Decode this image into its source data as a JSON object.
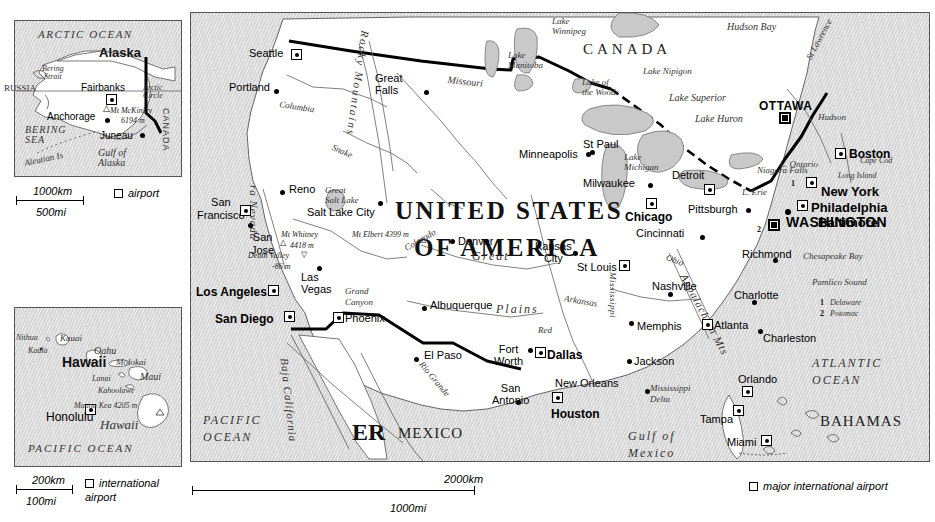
{
  "figure": {
    "type": "reference-map",
    "panels": [
      "alaska-inset",
      "hawaii-inset",
      "main-map"
    ]
  },
  "alaska": {
    "title": "Alaska",
    "ocean_labels": [
      "ARCTIC OCEAN",
      "BERING SEA",
      "Gulf of Alaska"
    ],
    "water_features": [
      "Bering Strait",
      "Aleutian Is"
    ],
    "neighbours": [
      "RUSSIA",
      "CANADA"
    ],
    "reference_line": "Arctic Circle",
    "cities": [
      {
        "name": "Fairbanks",
        "marker": "airport"
      },
      {
        "name": "Anchorage",
        "marker": "dot"
      },
      {
        "name": "Juneau",
        "marker": "dot"
      }
    ],
    "peaks": [
      {
        "name": "Mt McKinley",
        "elevation": "6194 m"
      }
    ],
    "scale": {
      "km": "1000km",
      "mi": "500mi"
    },
    "legend": {
      "symbol": "hollow-square",
      "label": "airport"
    }
  },
  "hawaii": {
    "title": "Hawaii",
    "ocean_label": "PACIFIC OCEAN",
    "islands": [
      "Nithua",
      "Kauai",
      "Kaula",
      "Oahu",
      "Molokai",
      "Lanai",
      "Maui",
      "Kahoolawe",
      "Hawaii"
    ],
    "cities": [
      {
        "name": "Honolulu",
        "marker": "airport"
      }
    ],
    "peaks": [
      {
        "name": "Mauna Kea",
        "elevation": "4205 m"
      }
    ],
    "scale": {
      "km": "200km",
      "mi": "100mi"
    },
    "legend": {
      "symbol": "hollow-square",
      "label": "international airport"
    }
  },
  "main": {
    "country_labels": [
      "UNITED STATES",
      "OF AMERICA",
      "CANADA",
      "MEXICO",
      "ER",
      "BAHAMAS"
    ],
    "oceans": [
      "PACIFIC OCEAN",
      "ATLANTIC OCEAN",
      "Gulf of Mexico"
    ],
    "regions": [
      "Great Plains",
      "Rocky Mountains",
      "Sierra Nevada",
      "Appalachian Mts",
      "Baja California",
      "Grand Canyon",
      "Mississippi Delta"
    ],
    "lakes": [
      "Lake Winnipeg",
      "Lake Manitoba",
      "Lake of the Woods",
      "Lake Nipigon",
      "Lake Superior",
      "Lake Huron",
      "Lake Michigan",
      "L. Erie",
      "L. Ontario",
      "Great Salt Lake",
      "Hudson Bay"
    ],
    "rivers": [
      "Columbia",
      "Snake",
      "Missouri",
      "Mississippi",
      "Arkansas",
      "Red",
      "Colorado",
      "Rio Grande",
      "Ohio",
      "St Lawrence",
      "Hudson"
    ],
    "coastal_features": [
      "Cape Cod",
      "Long Island",
      "Chesapeake Bay",
      "Pamlico Sound",
      "Niagara Falls"
    ],
    "peaks": [
      {
        "name": "Mt Whitney",
        "elevation": "4418 m"
      },
      {
        "name": "Mt Elbert",
        "elevation": "4399 m"
      },
      {
        "name": "Death Valley",
        "elevation": "-86 m"
      }
    ],
    "capitals": [
      {
        "name": "WASHINGTON",
        "marker": "capital-airport"
      },
      {
        "name": "OTTAWA",
        "marker": "capital-airport"
      }
    ],
    "cities": [
      {
        "name": "Seattle",
        "marker": "airport"
      },
      {
        "name": "Portland",
        "marker": "dot"
      },
      {
        "name": "Great Falls",
        "marker": "dot"
      },
      {
        "name": "San Francisco",
        "marker": "airport"
      },
      {
        "name": "San Jose",
        "marker": "dot"
      },
      {
        "name": "Reno",
        "marker": "dot"
      },
      {
        "name": "Salt Lake City",
        "marker": "dot"
      },
      {
        "name": "Las Vegas",
        "marker": "dot"
      },
      {
        "name": "Los Angeles",
        "marker": "airport"
      },
      {
        "name": "San Diego",
        "marker": "airport"
      },
      {
        "name": "Phoenix",
        "marker": "airport"
      },
      {
        "name": "Albuquerque",
        "marker": "dot"
      },
      {
        "name": "El Paso",
        "marker": "dot"
      },
      {
        "name": "Denver",
        "marker": "dot"
      },
      {
        "name": "Minneapolis",
        "marker": "dot"
      },
      {
        "name": "St Paul",
        "marker": "dot"
      },
      {
        "name": "Milwaukee",
        "marker": "dot"
      },
      {
        "name": "Chicago",
        "marker": "airport"
      },
      {
        "name": "Detroit",
        "marker": "airport"
      },
      {
        "name": "Pittsburgh",
        "marker": "dot"
      },
      {
        "name": "Cincinnati",
        "marker": "dot"
      },
      {
        "name": "Kansas City",
        "marker": "dot"
      },
      {
        "name": "St Louis",
        "marker": "airport"
      },
      {
        "name": "Fort Worth",
        "marker": "dot"
      },
      {
        "name": "Dallas",
        "marker": "airport"
      },
      {
        "name": "San Antonio",
        "marker": "dot"
      },
      {
        "name": "Houston",
        "marker": "airport"
      },
      {
        "name": "New Orleans",
        "marker": "dot"
      },
      {
        "name": "Jackson",
        "marker": "dot"
      },
      {
        "name": "Memphis",
        "marker": "dot"
      },
      {
        "name": "Nashville",
        "marker": "dot"
      },
      {
        "name": "Atlanta",
        "marker": "airport"
      },
      {
        "name": "Charlotte",
        "marker": "dot"
      },
      {
        "name": "Charleston",
        "marker": "dot"
      },
      {
        "name": "Richmond",
        "marker": "dot"
      },
      {
        "name": "Baltimore",
        "marker": "dot"
      },
      {
        "name": "Philadelphia",
        "marker": "airport"
      },
      {
        "name": "New York",
        "marker": "airport"
      },
      {
        "name": "Boston",
        "marker": "airport"
      },
      {
        "name": "Orlando",
        "marker": "airport"
      },
      {
        "name": "Tampa",
        "marker": "airport"
      },
      {
        "name": "Miami",
        "marker": "airport"
      }
    ],
    "numbered_keys": [
      {
        "num": "1",
        "name": "Delaware"
      },
      {
        "num": "2",
        "name": "Potomac"
      }
    ],
    "scale": {
      "km": "2000km",
      "mi": "1000mi"
    },
    "legend": {
      "symbol": "hollow-square",
      "label": "major international airport"
    }
  },
  "labels": {
    "ak_title": "Alaska",
    "ak_arctic_ocean": "ARCTIC OCEAN",
    "ak_bering_strait": "Bering\nStrait",
    "ak_russia": "RUSSIA",
    "ak_canada": "CANADA",
    "ak_arctic_circle": "Arctic\nCircle",
    "ak_fairbanks": "Fairbanks",
    "ak_mckinley": "Mt McKinley",
    "ak_mckinley_el": "6194 m",
    "ak_anchorage": "Anchorage",
    "ak_juneau": "Juneau",
    "ak_bering_sea": "BERING\nSEA",
    "ak_aleutian": "Aleutian Is",
    "ak_gulf": "Gulf of\nAlaska",
    "ak_scale_km": "1000km",
    "ak_scale_mi": "500mi",
    "ak_legend": "airport",
    "hi_title": "Hawaii",
    "hi_nithua": "Nithua",
    "hi_kauai": "Kauai",
    "hi_kaula": "Kaula",
    "hi_oahu": "Oahu",
    "hi_honolulu": "Honolulu",
    "hi_molokai": "Molokai",
    "hi_lanai": "Lanai",
    "hi_maui": "Maui",
    "hi_kahoolawe": "Kahoolawe",
    "hi_maunakea": "Mauna Kea 4205 m",
    "hi_bigisland": "Hawaii",
    "hi_pacific": "PACIFIC OCEAN",
    "hi_scale_km": "200km",
    "hi_scale_mi": "100mi",
    "hi_legend": "international\nairport",
    "m_canada": "CANADA",
    "m_us1": "UNITED STATES",
    "m_us2": "OF AMERICA",
    "m_mexico": "MEXICO",
    "m_er": "ER",
    "m_bahamas": "BAHAMAS",
    "m_pacific": "PACIFIC\nOCEAN",
    "m_atlantic": "ATLANTIC\nOCEAN",
    "m_gulf": "Gulf of\nMexico",
    "m_hudson_bay": "Hudson Bay",
    "m_lk_winnipeg": "Lake\nWinnipeg",
    "m_lk_manitoba": "Lake\nManitoba",
    "m_lk_woods": "Lake of\nthe Woods",
    "m_lk_nipigon": "Lake Nipigon",
    "m_lk_superior": "Lake Superior",
    "m_lk_huron": "Lake Huron",
    "m_lk_michigan": "Lake\nMichigan",
    "m_l_erie": "L. Erie",
    "m_l_ontario": "L. Ontario",
    "m_niagara": "Niagara Falls",
    "m_stlawrence": "St Lawrence",
    "m_hudson": "Hudson",
    "m_capecod": "Cape Cod",
    "m_longisland": "Long Island",
    "m_chesapeake": "Chesapeake Bay",
    "m_pamlico": "Pamlico Sound",
    "m_rockies": "Rocky Mountains",
    "m_sierra": "ra Nevada",
    "m_appalachian": "Appalachian Mts",
    "m_greatplains_g": "Great",
    "m_greatplains_p": "Plains",
    "m_baja": "Baja California",
    "m_grandcanyon": "Grand\nCanyon",
    "m_missdelta": "Mississippi\nDelta",
    "m_greatsaltlake": "Great\nSalt Lake",
    "m_columbia": "Columbia",
    "m_snake": "Snake",
    "m_missouri": "Missouri",
    "m_mississippi": "Mississippi",
    "m_arkansas": "Arkansas",
    "m_red": "Red",
    "m_colorado": "Colorado",
    "m_riogrande": "Rio Grande",
    "m_ohio": "Ohio",
    "m_whitney": "Mt Whitney",
    "m_whitney_el": "4418 m",
    "m_elbert": "Mt Elbert 4399 m",
    "m_deathvalley": "Death Valley",
    "m_deathvalley_el": "-86 m",
    "m_seattle": "Seattle",
    "m_portland": "Portland",
    "m_greatfalls": "Great\nFalls",
    "m_sanfrancisco": "San\nFrancisco",
    "m_sanjose": "San\nJose",
    "m_reno": "Reno",
    "m_saltlakecity": "Salt Lake City",
    "m_lasvegas": "Las\nVegas",
    "m_losangeles": "Los Angeles",
    "m_sandiego": "San Diego",
    "m_phoenix": "Phoenix",
    "m_albuquerque": "Albuquerque",
    "m_elpaso": "El Paso",
    "m_denver": "Denver",
    "m_minneapolis": "Minneapolis",
    "m_stpaul": "St Paul",
    "m_milwaukee": "Milwaukee",
    "m_chicago": "Chicago",
    "m_detroit": "Detroit",
    "m_pittsburgh": "Pittsburgh",
    "m_cincinnati": "Cincinnati",
    "m_kansascity": "Kansas\nCity",
    "m_stlouis": "St Louis",
    "m_fortworth": "Fort\nWorth",
    "m_dallas": "Dallas",
    "m_sanantonio": "San\nAntonio",
    "m_houston": "Houston",
    "m_neworleans": "New Orleans",
    "m_jackson": "Jackson",
    "m_memphis": "Memphis",
    "m_nashville": "Nashville",
    "m_atlanta": "Atlanta",
    "m_charlotte": "Charlotte",
    "m_charleston": "Charleston",
    "m_richmond": "Richmond",
    "m_ottawa": "OTTAWA",
    "m_boston": "Boston",
    "m_newyork": "New York",
    "m_philadelphia": "Philadelphia",
    "m_baltimore": "Baltimore",
    "m_washington": "WASHINGTON",
    "m_orlando": "Orlando",
    "m_tampa": "Tampa",
    "m_miami": "Miami",
    "m_key1num": "1",
    "m_key1": "Delaware",
    "m_key2num": "2",
    "m_key2": "Potomac",
    "m_scale_km": "2000km",
    "m_scale_mi": "1000mi",
    "m_legend": "major international airport"
  }
}
